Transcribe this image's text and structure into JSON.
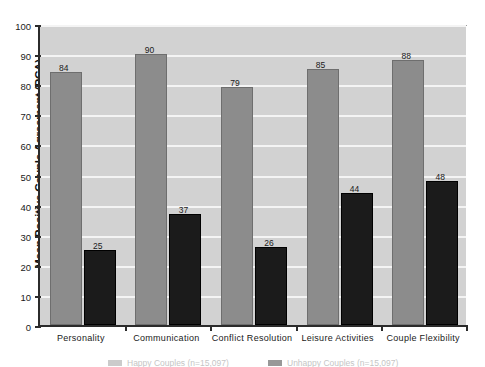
{
  "chart_data": {
    "type": "bar",
    "title": "",
    "xlabel": "",
    "ylabel": "Mean Positive Couple Agreement (PCA)",
    "ylim": [
      0,
      100
    ],
    "ytick_step": 10,
    "grid": true,
    "legend_position": "bottom",
    "categories": [
      "Personality",
      "Communication",
      "Conflict Resolution",
      "Leisure Activities",
      "Couple Flexibility"
    ],
    "yticks": [
      "0",
      "10",
      "20",
      "30",
      "40",
      "50",
      "60",
      "70",
      "80",
      "90",
      "100"
    ],
    "series": [
      {
        "name": "Happy Couples (n=15,097)",
        "color": "#8c8c8c",
        "values": [
          84,
          90,
          79,
          85,
          88
        ]
      },
      {
        "name": "Unhappy Couples (n=15,097)",
        "color": "#1b1b1b",
        "values": [
          25,
          37,
          26,
          44,
          48
        ]
      }
    ]
  },
  "colors": {
    "plot_background": "#d2d2d2",
    "gridline": "#f4f4f4",
    "axis": "#2b2b2b",
    "series_light": "#8c8c8c",
    "series_dark": "#1b1b1b",
    "text": "#1a1a1a",
    "page_background": "#ffffff"
  }
}
